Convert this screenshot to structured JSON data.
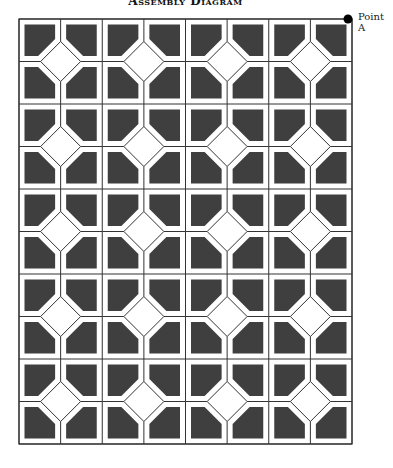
{
  "title": "Assembly Diagram",
  "point_label": "Point A",
  "grid": {
    "block_cols": 4,
    "block_rows": 5,
    "cells_per_block": 2,
    "left": 19,
    "top": 19,
    "right": 352,
    "bottom": 444
  },
  "colors": {
    "dark_fill": "#3f3f3f",
    "line": "#333333",
    "background": "#ffffff"
  }
}
